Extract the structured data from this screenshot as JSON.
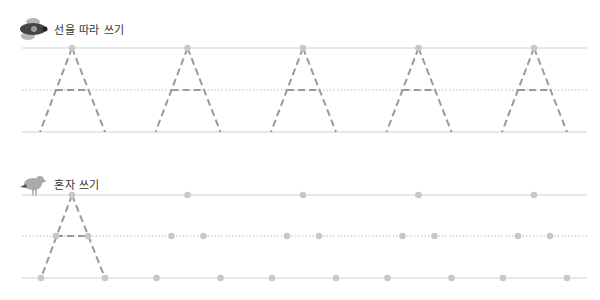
{
  "section1": {
    "title": "선을 따라 쓰기",
    "icon": "airplane-icon",
    "letter": "A",
    "repetitions": 5
  },
  "section2": {
    "title": "혼자 쓰기",
    "icon": "bird-icon",
    "letter": "A"
  },
  "colors": {
    "line": "#cfcfcf",
    "dash": "#9a9a9a",
    "dot": "#c8c8c8"
  }
}
